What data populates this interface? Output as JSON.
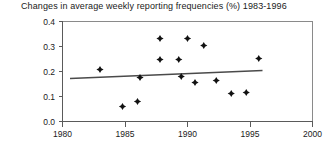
{
  "chart_data": {
    "type": "scatter",
    "title": "Changes in average weekly reporting frequencies (%) 1983-1996",
    "xlabel": "",
    "ylabel": "",
    "xlim": [
      1980,
      2000
    ],
    "ylim": [
      0.0,
      0.4
    ],
    "xticks": [
      1980,
      1985,
      1990,
      1995,
      2000
    ],
    "xtick_labels": [
      "1980",
      "1985",
      "1990",
      "1995",
      "2000"
    ],
    "yticks": [
      0.0,
      0.1,
      0.2,
      0.3,
      0.4
    ],
    "ytick_labels": [
      "0.0",
      "0.1",
      "0.2",
      "0.3",
      "0.4"
    ],
    "grid": false,
    "legend": "none",
    "marker": "filled-diamond",
    "marker_color": "#111111",
    "points": [
      {
        "x": 1983.0,
        "y": 0.208
      },
      {
        "x": 1984.8,
        "y": 0.06
      },
      {
        "x": 1986.0,
        "y": 0.08
      },
      {
        "x": 1987.8,
        "y": 0.248
      },
      {
        "x": 1989.3,
        "y": 0.248
      },
      {
        "x": 1989.5,
        "y": 0.18
      },
      {
        "x": 1987.8,
        "y": 0.332
      },
      {
        "x": 1986.2,
        "y": 0.176
      },
      {
        "x": 1990.0,
        "y": 0.332
      },
      {
        "x": 1990.6,
        "y": 0.156
      },
      {
        "x": 1991.3,
        "y": 0.304
      },
      {
        "x": 1992.3,
        "y": 0.164
      },
      {
        "x": 1993.5,
        "y": 0.112
      },
      {
        "x": 1994.7,
        "y": 0.116
      },
      {
        "x": 1995.7,
        "y": 0.252
      }
    ],
    "trend_line": {
      "label": "linear fit",
      "x_start": 1980.6,
      "y_start": 0.172,
      "x_end": 1996.0,
      "y_end": 0.204,
      "color": "#4a4a4a"
    }
  },
  "axes": {
    "x_axis_name": "year-axis",
    "y_axis_name": "frequency-axis"
  }
}
